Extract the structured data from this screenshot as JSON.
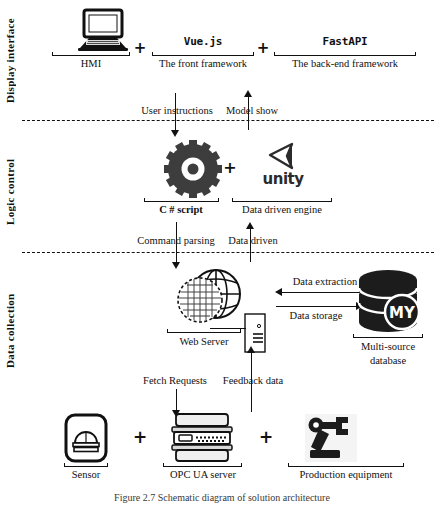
{
  "figure": {
    "caption": "Figure 2.7  Schematic diagram of solution architecture"
  },
  "bands": [
    {
      "id": "display",
      "label": "Display interface"
    },
    {
      "id": "logic",
      "label": "Logic control"
    },
    {
      "id": "data",
      "label": "Data collection"
    }
  ],
  "display_layer": {
    "items": [
      {
        "icon": "monitor-icon",
        "title": "",
        "label": "HMI"
      },
      {
        "icon": "",
        "title": "Vue.js",
        "label": "The front framework"
      },
      {
        "icon": "",
        "title": "FastAPI",
        "label": "The back-end framework"
      }
    ],
    "plus_signs": [
      "+",
      "+"
    ]
  },
  "logic_layer": {
    "items": [
      {
        "icon": "gear-icon",
        "title": "",
        "label": "C #  script"
      },
      {
        "icon": "unity-icon",
        "title": "unity",
        "label": "Data driven engine"
      }
    ],
    "plus_signs": [
      "+"
    ]
  },
  "data_layer": {
    "web_server": {
      "icon": "globe-icon",
      "label": "Web Server"
    },
    "server_tower": {
      "icon": "server-tower-icon"
    },
    "database": {
      "icon": "database-icon",
      "badge": "MY",
      "label_line1": "Multi-source",
      "label_line2": "database"
    },
    "db_flows": [
      {
        "label": "Data extraction",
        "direction": "left"
      },
      {
        "label": "Data storage",
        "direction": "right"
      }
    ]
  },
  "device_layer": {
    "items": [
      {
        "icon": "sensor-icon",
        "label": "Sensor"
      },
      {
        "icon": "opcua-server-icon",
        "label": "OPC UA server"
      },
      {
        "icon": "robot-arm-icon",
        "label": "Production equipment"
      }
    ],
    "plus_signs": [
      "+",
      "+"
    ]
  },
  "flows": [
    {
      "id": "user-instructions",
      "label": "User instructions",
      "direction": "down"
    },
    {
      "id": "model-show",
      "label": "Model show",
      "direction": "up"
    },
    {
      "id": "command-parsing",
      "label": "Command parsing",
      "direction": "down"
    },
    {
      "id": "data-driven",
      "label": "Data driven",
      "direction": "up"
    },
    {
      "id": "fetch-requests",
      "label": "Fetch Requests",
      "direction": "down"
    },
    {
      "id": "feedback-data",
      "label": "Feedback data",
      "direction": "up"
    }
  ],
  "colors": {
    "ink": "#111111",
    "icon_dark": "#3a3a3a",
    "paper": "#ffffff"
  }
}
